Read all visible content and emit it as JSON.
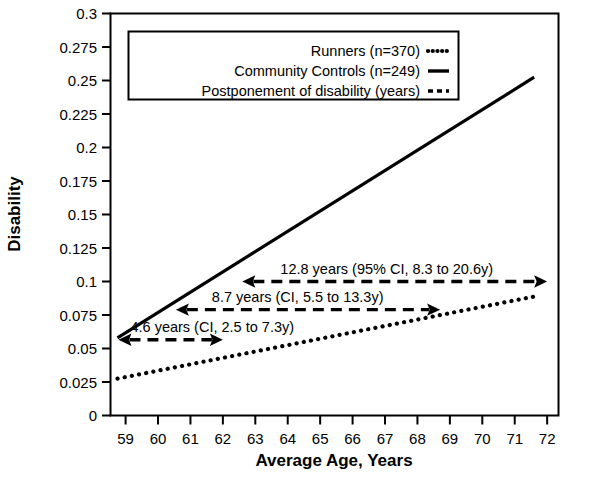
{
  "chart_data": {
    "type": "line",
    "title": "",
    "xlabel": "Average Age, Years",
    "ylabel": "Disability",
    "xlim": [
      58.55,
      72.35
    ],
    "ylim": [
      0,
      0.3
    ],
    "grid": false,
    "legend_position": "top-center",
    "x_ticks": [
      "59",
      "60",
      "61",
      "62",
      "63",
      "64",
      "65",
      "66",
      "67",
      "68",
      "69",
      "70",
      "71",
      "72"
    ],
    "x_tick_values": [
      59,
      60,
      61,
      62,
      63,
      64,
      65,
      66,
      67,
      68,
      69,
      70,
      71,
      72
    ],
    "y_ticks": [
      "0",
      "0.025",
      "0.05",
      "0.075",
      "0.1",
      "0.125",
      "0.15",
      "0.175",
      "0.2",
      "0.225",
      "0.25",
      "0.275",
      "0.3"
    ],
    "y_tick_values": [
      0,
      0.025,
      0.05,
      0.075,
      0.1,
      0.125,
      0.15,
      0.175,
      0.2,
      0.225,
      0.25,
      0.275,
      0.3
    ],
    "series": [
      {
        "name": "Runners (n=370)",
        "style": "dotted",
        "color": "#000000",
        "x": [
          58.75,
          71.75
        ],
        "values": [
          0.0275,
          0.0895
        ]
      },
      {
        "name": "Community Controls (n=249)",
        "style": "solid",
        "color": "#000000",
        "x": [
          58.75,
          71.6
        ],
        "values": [
          0.058,
          0.2525
        ]
      }
    ],
    "annotations": [
      {
        "label": "12.8 years (95% CI, 8.3 to 20.6y)",
        "style": "dashed",
        "arrow": "both",
        "y": 0.1,
        "x_start": 62.6,
        "x_end": 72.0
      },
      {
        "label": "8.7 years (CI, 5.5 to 13.3y)",
        "style": "dashed",
        "arrow": "both",
        "y": 0.079,
        "x_start": 60.55,
        "x_end": 68.7
      },
      {
        "label": "4.6 years (CI, 2.5 to 7.3y)",
        "style": "dashed",
        "arrow": "both",
        "y": 0.0565,
        "x_start": 58.78,
        "x_end": 62.0
      }
    ]
  },
  "legend": {
    "items": [
      {
        "label": "Runners (n=370)",
        "style": "dotted"
      },
      {
        "label": "Community Controls (n=249)",
        "style": "solid"
      },
      {
        "label": "Postponement of disability (years)",
        "style": "dashed"
      }
    ]
  },
  "axes": {
    "x_title": "Average Age, Years",
    "y_title": "Disability"
  },
  "colors": {
    "ink": "#000000",
    "background": "#ffffff"
  }
}
